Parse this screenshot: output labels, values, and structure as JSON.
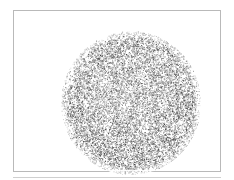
{
  "figure": {
    "caption": "",
    "background_color": "#ffffff",
    "frame": {
      "stroke_color": "#b9b9b9",
      "stroke_width_px": 1,
      "x": 13,
      "y": 10,
      "width": 208,
      "height": 162
    },
    "baseline_rule": {
      "color": "#cfcfcf",
      "x": 13,
      "y": 177,
      "width": 208
    },
    "subject": {
      "name": "stippled-disc",
      "shape": "circle",
      "center_x": 117,
      "center_y": 92,
      "radius_x": 70,
      "radius_y": 72,
      "fill_style": "random-grayscale-stipple-noise",
      "ink_color": "#3a3a3a",
      "mid_tone": "#8f8f8f",
      "light_tone": "#d6d6d6",
      "mean_gray": "#949494",
      "edge": "soft-feathered",
      "description": "dense randomly distributed grayscale speckle forming a filled disc with faint lighter mottling toward the interior"
    }
  },
  "chart_data": {
    "type": "heatmap",
    "title": "",
    "xlabel": "",
    "ylabel": "",
    "grid": false,
    "legend": "none",
    "xlim": [
      0,
      234
    ],
    "ylim": [
      0,
      180
    ],
    "categories": [],
    "values": [],
    "annotations": []
  }
}
